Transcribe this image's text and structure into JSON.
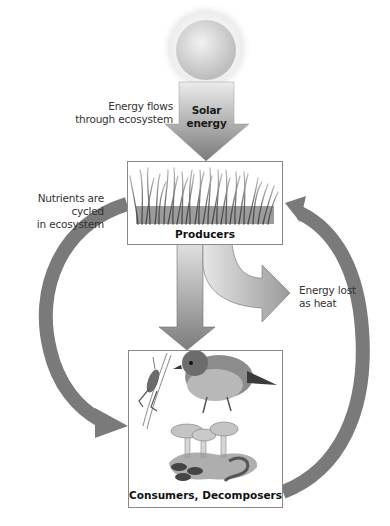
{
  "diagram": {
    "nodes": {
      "sun": {
        "label": "",
        "icon": "sun-icon"
      },
      "solar_energy": {
        "label_line1": "Solar",
        "label_line2": "energy"
      },
      "producers": {
        "label": "Producers",
        "illustration": "grass-illustration"
      },
      "consumers": {
        "label": "Consumers, Decomposers",
        "illustration": "grasshopper-bird-mushroom-worm-illustration"
      }
    },
    "annotations": {
      "energy_flow_line1": "Energy flows",
      "energy_flow_line2": "through ecosystem",
      "nutrients_line1": "Nutrients are cycled",
      "nutrients_line2": "in ecosystem",
      "heat_line1": "Energy lost",
      "heat_line2": "as heat"
    },
    "edges": [
      {
        "from": "sun",
        "to": "producers",
        "label": "Solar energy"
      },
      {
        "from": "producers",
        "to": "consumers",
        "label": ""
      },
      {
        "from": "producers",
        "to": "environment",
        "label": "Energy lost as heat"
      },
      {
        "from": "producers",
        "to": "consumers",
        "label": "Nutrients are cycled in ecosystem",
        "style": "left arc"
      },
      {
        "from": "consumers",
        "to": "producers",
        "label": "",
        "style": "right arc"
      }
    ],
    "colors": {
      "arc": "#7a7a7a",
      "arrow_light": "#e2e2e2",
      "arrow_dark": "#7e7e7e",
      "box_border": "#8a8a8a"
    }
  }
}
